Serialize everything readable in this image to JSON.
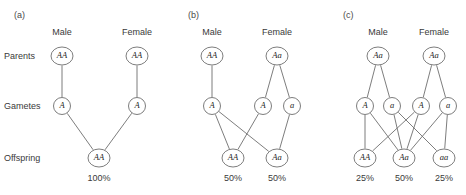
{
  "figure": {
    "row_labels": [
      {
        "id": "parents",
        "label": "Parents",
        "y": 56
      },
      {
        "id": "gametes",
        "label": "Gametes",
        "y": 106
      },
      {
        "id": "offspring",
        "label": "Offspring",
        "y": 158
      }
    ],
    "stroke_color": "#6e6e6e",
    "node_fill": "#ffffff",
    "text_color": "#1c1c1c",
    "background": "#ffffff"
  },
  "panels": [
    {
      "id": "a",
      "label": "(a)",
      "label_x": 14,
      "label_y": 18,
      "sexes": [
        {
          "id": "male",
          "label": "Male",
          "x": 62,
          "y": 35
        },
        {
          "id": "female",
          "label": "Female",
          "x": 137,
          "y": 35
        }
      ],
      "parents": [
        {
          "id": "p-male",
          "genotype": "AA",
          "x": 62,
          "y": 56,
          "rx": 11,
          "ry": 9
        },
        {
          "id": "p-female",
          "genotype": "AA",
          "x": 137,
          "y": 56,
          "rx": 11,
          "ry": 9
        }
      ],
      "gametes": [
        {
          "id": "g-male-A",
          "genotype": "A",
          "x": 62,
          "y": 106,
          "rx": 8.5,
          "ry": 8.5
        },
        {
          "id": "g-female-A",
          "genotype": "A",
          "x": 137,
          "y": 106,
          "rx": 8.5,
          "ry": 8.5
        }
      ],
      "offspring": [
        {
          "id": "o-AA",
          "genotype": "AA",
          "x": 99,
          "y": 158,
          "rx": 11,
          "ry": 9
        }
      ],
      "percentages": [
        {
          "id": "pct-AA",
          "value": "100%",
          "x": 99,
          "y": 181
        }
      ],
      "edges": [
        {
          "from": "p-male",
          "to": "g-male-A"
        },
        {
          "from": "p-female",
          "to": "g-female-A"
        },
        {
          "from": "g-male-A",
          "to": "o-AA"
        },
        {
          "from": "g-female-A",
          "to": "o-AA"
        }
      ]
    },
    {
      "id": "b",
      "label": "(b)",
      "label_x": 188,
      "label_y": 18,
      "sexes": [
        {
          "id": "male",
          "label": "Male",
          "x": 212,
          "y": 35
        },
        {
          "id": "female",
          "label": "Female",
          "x": 277,
          "y": 35
        }
      ],
      "parents": [
        {
          "id": "p-male",
          "genotype": "AA",
          "x": 212,
          "y": 56,
          "rx": 11,
          "ry": 9
        },
        {
          "id": "p-female",
          "genotype": "Aa",
          "x": 277,
          "y": 56,
          "rx": 11,
          "ry": 9
        }
      ],
      "gametes": [
        {
          "id": "g-male-A",
          "genotype": "A",
          "x": 212,
          "y": 106,
          "rx": 8.5,
          "ry": 8.5
        },
        {
          "id": "g-female-A",
          "genotype": "A",
          "x": 263,
          "y": 106,
          "rx": 8.5,
          "ry": 8.5
        },
        {
          "id": "g-female-a",
          "genotype": "a",
          "x": 292,
          "y": 106,
          "rx": 8.5,
          "ry": 8.5
        }
      ],
      "offspring": [
        {
          "id": "o-AA",
          "genotype": "AA",
          "x": 233,
          "y": 158,
          "rx": 11,
          "ry": 9
        },
        {
          "id": "o-Aa",
          "genotype": "Aa",
          "x": 277,
          "y": 158,
          "rx": 11,
          "ry": 9
        }
      ],
      "percentages": [
        {
          "id": "pct-AA",
          "value": "50%",
          "x": 233,
          "y": 181
        },
        {
          "id": "pct-Aa",
          "value": "50%",
          "x": 277,
          "y": 181
        }
      ],
      "edges": [
        {
          "from": "p-male",
          "to": "g-male-A"
        },
        {
          "from": "p-female",
          "to": "g-female-A"
        },
        {
          "from": "p-female",
          "to": "g-female-a"
        },
        {
          "from": "g-male-A",
          "to": "o-AA"
        },
        {
          "from": "g-male-A",
          "to": "o-Aa"
        },
        {
          "from": "g-female-A",
          "to": "o-AA"
        },
        {
          "from": "g-female-a",
          "to": "o-Aa"
        }
      ]
    },
    {
      "id": "c",
      "label": "(c)",
      "label_x": 343,
      "label_y": 18,
      "sexes": [
        {
          "id": "male",
          "label": "Male",
          "x": 378,
          "y": 35
        },
        {
          "id": "female",
          "label": "Female",
          "x": 434,
          "y": 35
        }
      ],
      "parents": [
        {
          "id": "p-male",
          "genotype": "Aa",
          "x": 378,
          "y": 56,
          "rx": 11,
          "ry": 9
        },
        {
          "id": "p-female",
          "genotype": "Aa",
          "x": 434,
          "y": 56,
          "rx": 11,
          "ry": 9
        }
      ],
      "gametes": [
        {
          "id": "g-male-A",
          "genotype": "A",
          "x": 365,
          "y": 106,
          "rx": 8.5,
          "ry": 8.5
        },
        {
          "id": "g-male-a",
          "genotype": "a",
          "x": 392,
          "y": 106,
          "rx": 8.5,
          "ry": 8.5
        },
        {
          "id": "g-female-A",
          "genotype": "A",
          "x": 421,
          "y": 106,
          "rx": 8.5,
          "ry": 8.5
        },
        {
          "id": "g-female-a",
          "genotype": "a",
          "x": 448,
          "y": 106,
          "rx": 8.5,
          "ry": 8.5
        }
      ],
      "offspring": [
        {
          "id": "o-AA",
          "genotype": "AA",
          "x": 365,
          "y": 158,
          "rx": 11,
          "ry": 9
        },
        {
          "id": "o-Aa",
          "genotype": "Aa",
          "x": 404,
          "y": 158,
          "rx": 11,
          "ry": 9
        },
        {
          "id": "o-aa",
          "genotype": "aa",
          "x": 444,
          "y": 158,
          "rx": 11,
          "ry": 9
        }
      ],
      "percentages": [
        {
          "id": "pct-AA",
          "value": "25%",
          "x": 365,
          "y": 181
        },
        {
          "id": "pct-Aa",
          "value": "50%",
          "x": 404,
          "y": 181
        },
        {
          "id": "pct-aa",
          "value": "25%",
          "x": 444,
          "y": 181
        }
      ],
      "edges": [
        {
          "from": "p-male",
          "to": "g-male-A"
        },
        {
          "from": "p-male",
          "to": "g-male-a"
        },
        {
          "from": "p-female",
          "to": "g-female-A"
        },
        {
          "from": "p-female",
          "to": "g-female-a"
        },
        {
          "from": "g-male-A",
          "to": "o-AA"
        },
        {
          "from": "g-male-A",
          "to": "o-Aa"
        },
        {
          "from": "g-male-a",
          "to": "o-Aa"
        },
        {
          "from": "g-male-a",
          "to": "o-aa"
        },
        {
          "from": "g-female-A",
          "to": "o-AA"
        },
        {
          "from": "g-female-A",
          "to": "o-Aa"
        },
        {
          "from": "g-female-a",
          "to": "o-Aa"
        },
        {
          "from": "g-female-a",
          "to": "o-aa"
        }
      ]
    }
  ],
  "chart_data": {
    "type": "diagram",
    "crosses": [
      {
        "panel": "(a)",
        "male_parent": "AA",
        "female_parent": "AA",
        "male_gametes": [
          "A"
        ],
        "female_gametes": [
          "A"
        ],
        "offspring": [
          {
            "genotype": "AA",
            "percent": 100
          }
        ]
      },
      {
        "panel": "(b)",
        "male_parent": "AA",
        "female_parent": "Aa",
        "male_gametes": [
          "A"
        ],
        "female_gametes": [
          "A",
          "a"
        ],
        "offspring": [
          {
            "genotype": "AA",
            "percent": 50
          },
          {
            "genotype": "Aa",
            "percent": 50
          }
        ]
      },
      {
        "panel": "(c)",
        "male_parent": "Aa",
        "female_parent": "Aa",
        "male_gametes": [
          "A",
          "a"
        ],
        "female_gametes": [
          "A",
          "a"
        ],
        "offspring": [
          {
            "genotype": "AA",
            "percent": 25
          },
          {
            "genotype": "Aa",
            "percent": 50
          },
          {
            "genotype": "aa",
            "percent": 25
          }
        ]
      }
    ],
    "rows": [
      "Parents",
      "Gametes",
      "Offspring"
    ],
    "columns": [
      "Male",
      "Female"
    ]
  }
}
